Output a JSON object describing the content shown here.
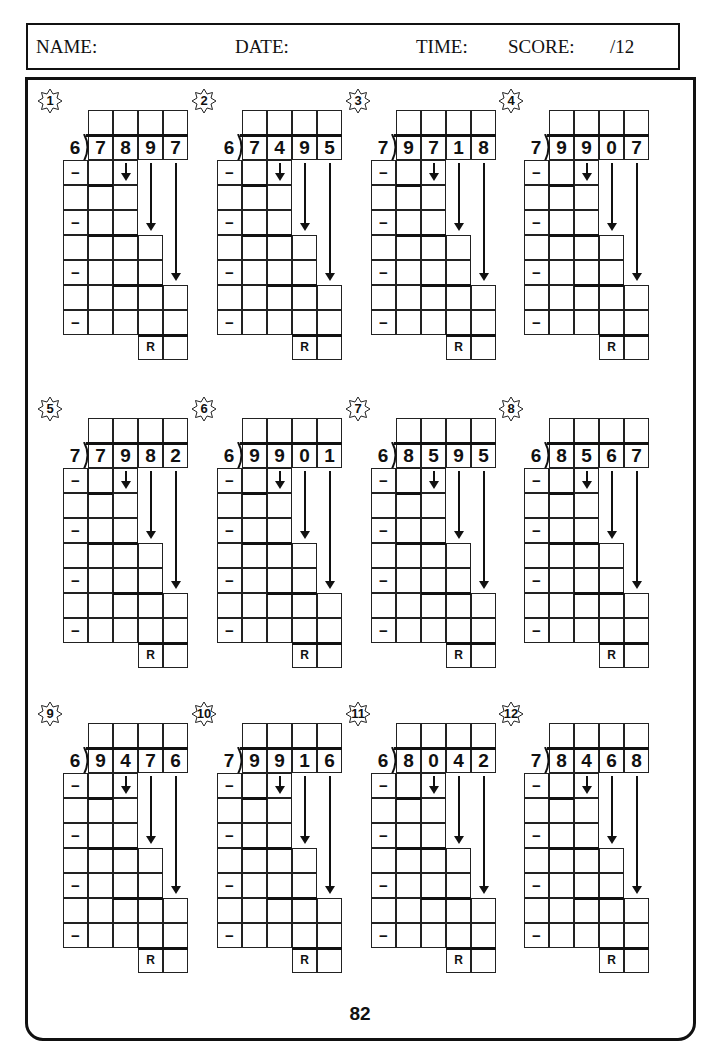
{
  "header": {
    "name_label": "NAME:",
    "date_label": "DATE:",
    "time_label": "TIME:",
    "score_label": "SCORE:",
    "score_total": "/12"
  },
  "problems": [
    {
      "number": "1",
      "divisor": "6",
      "dividend": [
        "7",
        "8",
        "9",
        "7"
      ]
    },
    {
      "number": "2",
      "divisor": "6",
      "dividend": [
        "7",
        "4",
        "9",
        "5"
      ]
    },
    {
      "number": "3",
      "divisor": "7",
      "dividend": [
        "9",
        "7",
        "1",
        "8"
      ]
    },
    {
      "number": "4",
      "divisor": "7",
      "dividend": [
        "9",
        "9",
        "0",
        "7"
      ]
    },
    {
      "number": "5",
      "divisor": "7",
      "dividend": [
        "7",
        "9",
        "8",
        "2"
      ]
    },
    {
      "number": "6",
      "divisor": "6",
      "dividend": [
        "9",
        "9",
        "0",
        "1"
      ]
    },
    {
      "number": "7",
      "divisor": "6",
      "dividend": [
        "8",
        "5",
        "9",
        "5"
      ]
    },
    {
      "number": "8",
      "divisor": "6",
      "dividend": [
        "8",
        "5",
        "6",
        "7"
      ]
    },
    {
      "number": "9",
      "divisor": "6",
      "dividend": [
        "9",
        "4",
        "7",
        "6"
      ]
    },
    {
      "number": "10",
      "divisor": "7",
      "dividend": [
        "9",
        "9",
        "1",
        "6"
      ]
    },
    {
      "number": "11",
      "divisor": "6",
      "dividend": [
        "8",
        "0",
        "4",
        "2"
      ]
    },
    {
      "number": "12",
      "divisor": "7",
      "dividend": [
        "8",
        "4",
        "6",
        "8"
      ]
    }
  ],
  "labels": {
    "minus": "−",
    "remainder": "R"
  },
  "icons": {
    "badge": "star-badge-icon",
    "arrow": "down-arrow-icon"
  },
  "page_number": "82"
}
